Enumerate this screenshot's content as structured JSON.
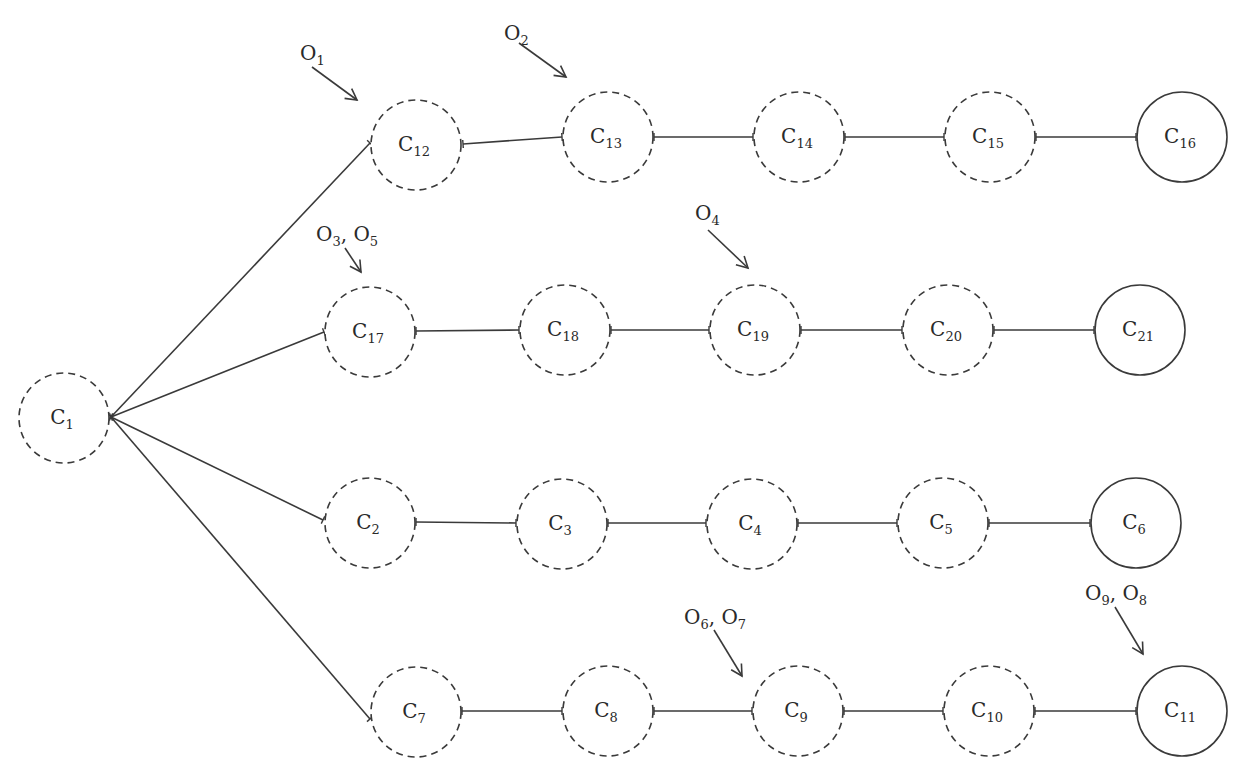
{
  "diagram": {
    "type": "tree",
    "colors": {
      "stroke": "#3a3a3a",
      "text": "#2a2a2a",
      "background": "#ffffff"
    },
    "radius": 45,
    "nodes": [
      {
        "id": "C1",
        "base": "C",
        "sub": "1",
        "x": 64,
        "y": 418,
        "style": "dashed"
      },
      {
        "id": "C12",
        "base": "C",
        "sub": "12",
        "x": 416,
        "y": 145,
        "style": "dashed"
      },
      {
        "id": "C13",
        "base": "C",
        "sub": "13",
        "x": 608,
        "y": 137,
        "style": "dashed"
      },
      {
        "id": "C14",
        "base": "C",
        "sub": "14",
        "x": 799,
        "y": 137,
        "style": "dashed"
      },
      {
        "id": "C15",
        "base": "C",
        "sub": "15",
        "x": 990,
        "y": 137,
        "style": "dashed"
      },
      {
        "id": "C16",
        "base": "C",
        "sub": "16",
        "x": 1182,
        "y": 137,
        "style": "solid"
      },
      {
        "id": "C17",
        "base": "C",
        "sub": "17",
        "x": 370,
        "y": 332,
        "style": "dashed"
      },
      {
        "id": "C18",
        "base": "C",
        "sub": "18",
        "x": 565,
        "y": 330,
        "style": "dashed"
      },
      {
        "id": "C19",
        "base": "C",
        "sub": "19",
        "x": 755,
        "y": 330,
        "style": "dashed"
      },
      {
        "id": "C20",
        "base": "C",
        "sub": "20",
        "x": 948,
        "y": 330,
        "style": "dashed"
      },
      {
        "id": "C21",
        "base": "C",
        "sub": "21",
        "x": 1140,
        "y": 330,
        "style": "solid"
      },
      {
        "id": "C2",
        "base": "C",
        "sub": "2",
        "x": 370,
        "y": 523,
        "style": "dashed"
      },
      {
        "id": "C3",
        "base": "C",
        "sub": "3",
        "x": 562,
        "y": 524,
        "style": "dashed"
      },
      {
        "id": "C4",
        "base": "C",
        "sub": "4",
        "x": 752,
        "y": 524,
        "style": "dashed"
      },
      {
        "id": "C5",
        "base": "C",
        "sub": "5",
        "x": 943,
        "y": 523,
        "style": "dashed"
      },
      {
        "id": "C6",
        "base": "C",
        "sub": "6",
        "x": 1136,
        "y": 523,
        "style": "solid"
      },
      {
        "id": "C7",
        "base": "C",
        "sub": "7",
        "x": 416,
        "y": 712,
        "style": "dashed"
      },
      {
        "id": "C8",
        "base": "C",
        "sub": "8",
        "x": 608,
        "y": 711,
        "style": "dashed"
      },
      {
        "id": "C9",
        "base": "C",
        "sub": "9",
        "x": 798,
        "y": 711,
        "style": "dashed"
      },
      {
        "id": "C10",
        "base": "C",
        "sub": "10",
        "x": 989,
        "y": 711,
        "style": "dashed"
      },
      {
        "id": "C11",
        "base": "C",
        "sub": "11",
        "x": 1182,
        "y": 711,
        "style": "solid"
      }
    ],
    "edges": [
      {
        "from": "C1",
        "to": "C12",
        "x1": 111,
        "y1": 417,
        "x2": 370,
        "y2": 143
      },
      {
        "from": "C1",
        "to": "C17",
        "x1": 111,
        "y1": 417,
        "x2": 324,
        "y2": 332
      },
      {
        "from": "C1",
        "to": "C2",
        "x1": 111,
        "y1": 417,
        "x2": 323,
        "y2": 520
      },
      {
        "from": "C1",
        "to": "C7",
        "x1": 111,
        "y1": 417,
        "x2": 370,
        "y2": 719
      },
      {
        "from": "C12",
        "to": "C13",
        "x1": 463,
        "y1": 144,
        "x2": 562,
        "y2": 137
      },
      {
        "from": "C13",
        "to": "C14",
        "x1": 654,
        "y1": 137,
        "x2": 753,
        "y2": 137
      },
      {
        "from": "C14",
        "to": "C15",
        "x1": 845,
        "y1": 137,
        "x2": 944,
        "y2": 137
      },
      {
        "from": "C15",
        "to": "C16",
        "x1": 1036,
        "y1": 137,
        "x2": 1136,
        "y2": 137
      },
      {
        "from": "C17",
        "to": "C18",
        "x1": 416,
        "y1": 331,
        "x2": 519,
        "y2": 330
      },
      {
        "from": "C18",
        "to": "C19",
        "x1": 611,
        "y1": 330,
        "x2": 709,
        "y2": 330
      },
      {
        "from": "C19",
        "to": "C20",
        "x1": 801,
        "y1": 330,
        "x2": 902,
        "y2": 330
      },
      {
        "from": "C20",
        "to": "C21",
        "x1": 994,
        "y1": 330,
        "x2": 1094,
        "y2": 330
      },
      {
        "from": "C2",
        "to": "C3",
        "x1": 416,
        "y1": 522,
        "x2": 516,
        "y2": 523
      },
      {
        "from": "C3",
        "to": "C4",
        "x1": 608,
        "y1": 523,
        "x2": 706,
        "y2": 523
      },
      {
        "from": "C4",
        "to": "C5",
        "x1": 798,
        "y1": 523,
        "x2": 897,
        "y2": 523
      },
      {
        "from": "C5",
        "to": "C6",
        "x1": 989,
        "y1": 523,
        "x2": 1090,
        "y2": 523
      },
      {
        "from": "C7",
        "to": "C8",
        "x1": 462,
        "y1": 711,
        "x2": 562,
        "y2": 711
      },
      {
        "from": "C8",
        "to": "C9",
        "x1": 654,
        "y1": 711,
        "x2": 752,
        "y2": 711
      },
      {
        "from": "C9",
        "to": "C10",
        "x1": 844,
        "y1": 711,
        "x2": 943,
        "y2": 711
      },
      {
        "from": "C10",
        "to": "C11",
        "x1": 1035,
        "y1": 711,
        "x2": 1136,
        "y2": 711
      }
    ],
    "observations": [
      {
        "id": "O1",
        "parts": [
          {
            "base": "O",
            "sub": "1"
          }
        ],
        "target": "C12",
        "lx": 300,
        "ly": 60,
        "ax1": 312,
        "ay1": 67,
        "ax2": 357,
        "ay2": 100
      },
      {
        "id": "O2",
        "parts": [
          {
            "base": "O",
            "sub": "2"
          }
        ],
        "target": "C13",
        "lx": 504,
        "ly": 40,
        "ax1": 519,
        "ay1": 43,
        "ax2": 566,
        "ay2": 77
      },
      {
        "id": "O3_O5",
        "parts": [
          {
            "base": "O",
            "sub": "3"
          },
          {
            "base": "O",
            "sub": "5"
          }
        ],
        "target": "C17",
        "lx": 316,
        "ly": 241,
        "ax1": 345,
        "ay1": 248,
        "ax2": 361,
        "ay2": 272
      },
      {
        "id": "O4",
        "parts": [
          {
            "base": "O",
            "sub": "4"
          }
        ],
        "target": "C19",
        "lx": 695,
        "ly": 220,
        "ax1": 708,
        "ay1": 230,
        "ax2": 748,
        "ay2": 268
      },
      {
        "id": "O6_O7",
        "parts": [
          {
            "base": "O",
            "sub": "6"
          },
          {
            "base": "O",
            "sub": "7"
          }
        ],
        "target": "C9",
        "lx": 684,
        "ly": 624,
        "ax1": 714,
        "ay1": 630,
        "ax2": 742,
        "ay2": 676
      },
      {
        "id": "O9_O8",
        "parts": [
          {
            "base": "O",
            "sub": "9"
          },
          {
            "base": "O",
            "sub": "8"
          }
        ],
        "target": "C11",
        "lx": 1085,
        "ly": 600,
        "ax1": 1115,
        "ay1": 607,
        "ax2": 1143,
        "ay2": 654
      }
    ]
  }
}
